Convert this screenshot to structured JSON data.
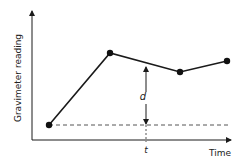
{
  "diagram": {
    "y_axis_label": "Gravimeter reading",
    "x_axis_label": "Time",
    "difference_label": "d",
    "time_marker_label": "t",
    "points": [
      {
        "x": 49,
        "y": 125
      },
      {
        "x": 110,
        "y": 53
      },
      {
        "x": 180,
        "y": 72
      },
      {
        "x": 227,
        "y": 61
      }
    ],
    "colors": {
      "line": "#1a1a1a",
      "dashed": "#555555"
    }
  }
}
